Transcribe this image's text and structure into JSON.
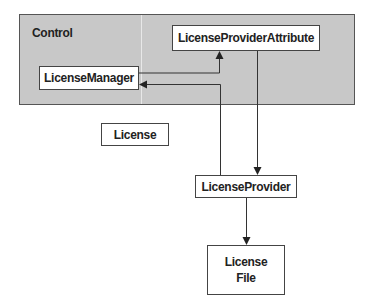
{
  "diagram": {
    "container": {
      "label": "Control",
      "fill": "#c8c8c8"
    },
    "nodes": {
      "license_provider_attribute": "LicenseProviderAttribute",
      "license_manager": "LicenseManager",
      "license": "License",
      "license_provider": "LicenseProvider",
      "license_file_line1": "License",
      "license_file_line2": "File"
    },
    "edges": [
      {
        "from": "LicenseManager",
        "to": "LicenseProviderAttribute"
      },
      {
        "from": "LicenseProviderAttribute",
        "to": "LicenseProvider"
      },
      {
        "from": "LicenseProvider",
        "to": "LicenseManager"
      },
      {
        "from": "LicenseProvider",
        "to": "License File"
      }
    ]
  }
}
